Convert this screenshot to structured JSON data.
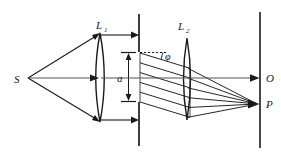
{
  "figure": {
    "background_color": "#ffffff",
    "stroke_color": "#1a1a1a"
  },
  "labels": {
    "source": "S",
    "lens1_base": "L",
    "lens1_sub": "1",
    "lens2_base": "L",
    "lens2_sub": "2",
    "slit_width": "a",
    "angle": "φ",
    "axis_point": "O",
    "focus_point": "P"
  },
  "geometry": {
    "source_point": {
      "x": 28,
      "y": 78
    },
    "lens1": {
      "cx": 100,
      "cy": 78,
      "top_y": 33,
      "bottom_y": 122,
      "half_width": 6
    },
    "lens2": {
      "cx": 187,
      "cy": 78,
      "top_y": 38,
      "bottom_y": 120,
      "half_width": 5
    },
    "aperture_plate": {
      "x": 139,
      "top_y": 14,
      "slit_top_y": 52,
      "slit_bottom_y": 102,
      "bottom_y": 146
    },
    "screen": {
      "x": 260,
      "top_y": 12,
      "bottom_y": 148
    },
    "axis": {
      "y": 78,
      "from_x": 28,
      "to_x": 258
    },
    "slit_dimension": {
      "x": 128,
      "top_y": 52,
      "bottom_y": 102
    },
    "focus_point_P": {
      "x": 258,
      "y": 104
    },
    "axis_point_O": {
      "x": 258,
      "y": 78
    },
    "diffraction_angle_degrees": 17,
    "ray_count_through_slit": 6
  },
  "elements": {
    "incident_rays": "3 rays diverging from S to lens L1 (upper edge, axis, lower edge)",
    "collimated_beam": "parallel horizontal arrows from L1 rim to aperture plate",
    "diffracted_rays": "tilted parallel rays at angle phi crossing the slit toward L2",
    "converging_rays": "rays focused by L2 onto point P on the screen",
    "reference_dashed_line": "horizontal dashed reference line from slit top used to mark angle phi"
  }
}
